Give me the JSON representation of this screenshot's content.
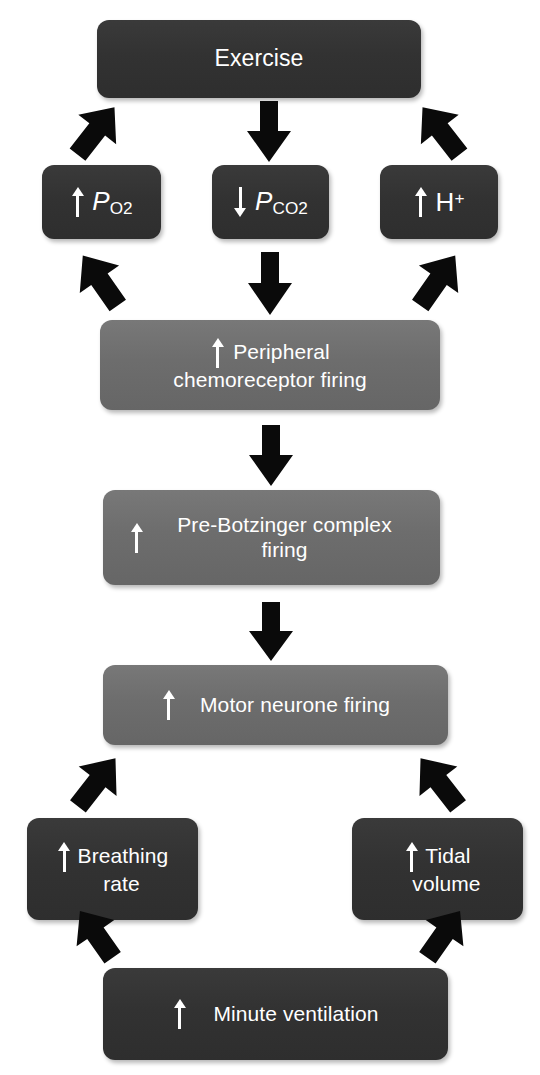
{
  "diagram": {
    "colors": {
      "dark_node": "#333333",
      "gray_node": "#6d6d6d",
      "arrow": "#0a0a0a",
      "text": "#ffffff",
      "background": "#ffffff"
    },
    "nodes": [
      {
        "id": "exercise",
        "label": "Exercise",
        "shade": "dark",
        "change": "none"
      },
      {
        "id": "po2",
        "label": "P",
        "sub": "O2",
        "shade": "dark",
        "change": "increase",
        "arrow_glyph": "up-arrow-icon"
      },
      {
        "id": "pco2",
        "label": "P",
        "sub": "CO2",
        "shade": "dark",
        "change": "decrease",
        "arrow_glyph": "down-arrow-icon"
      },
      {
        "id": "hplus",
        "label": "H",
        "sup": "+",
        "shade": "dark",
        "change": "increase",
        "arrow_glyph": "up-arrow-icon"
      },
      {
        "id": "peripheral-chemoreceptor",
        "line1": "Peripheral",
        "line2": "chemoreceptor firing",
        "shade": "gray",
        "change": "increase",
        "arrow_glyph": "up-arrow-icon"
      },
      {
        "id": "pre-botzinger",
        "line1": "Pre-Botzinger complex",
        "line2": "firing",
        "shade": "gray",
        "change": "increase",
        "arrow_glyph": "up-arrow-icon"
      },
      {
        "id": "motor-neurone",
        "label": "Motor neurone firing",
        "shade": "gray",
        "change": "increase",
        "arrow_glyph": "up-arrow-icon"
      },
      {
        "id": "breathing-rate",
        "line1": "Breathing",
        "line2": "rate",
        "shade": "dark",
        "change": "increase",
        "arrow_glyph": "up-arrow-icon"
      },
      {
        "id": "tidal-volume",
        "line1": "Tidal",
        "line2": "volume",
        "shade": "dark",
        "change": "increase",
        "arrow_glyph": "up-arrow-icon"
      },
      {
        "id": "minute-ventilation",
        "label": "Minute ventilation",
        "shade": "dark",
        "change": "increase",
        "arrow_glyph": "up-arrow-icon"
      }
    ],
    "connectors": [
      {
        "id": "exercise-to-po2",
        "from": "exercise",
        "to": "po2",
        "direction": "down-left"
      },
      {
        "id": "exercise-to-pco2",
        "from": "exercise",
        "to": "pco2",
        "direction": "down"
      },
      {
        "id": "exercise-to-hplus",
        "from": "exercise",
        "to": "hplus",
        "direction": "down-right"
      },
      {
        "id": "po2-to-chemoreceptor",
        "from": "po2",
        "to": "peripheral-chemoreceptor",
        "direction": "down-right"
      },
      {
        "id": "pco2-to-chemoreceptor",
        "from": "pco2",
        "to": "peripheral-chemoreceptor",
        "direction": "down"
      },
      {
        "id": "hplus-to-chemoreceptor",
        "from": "hplus",
        "to": "peripheral-chemoreceptor",
        "direction": "down-left"
      },
      {
        "id": "chemoreceptor-to-prebotzinger",
        "from": "peripheral-chemoreceptor",
        "to": "pre-botzinger",
        "direction": "down"
      },
      {
        "id": "prebotzinger-to-motor",
        "from": "pre-botzinger",
        "to": "motor-neurone",
        "direction": "down"
      },
      {
        "id": "motor-to-breathing-rate",
        "from": "motor-neurone",
        "to": "breathing-rate",
        "direction": "down-left"
      },
      {
        "id": "motor-to-tidal-volume",
        "from": "motor-neurone",
        "to": "tidal-volume",
        "direction": "down-right"
      },
      {
        "id": "breathing-rate-to-minute",
        "from": "breathing-rate",
        "to": "minute-ventilation",
        "direction": "down-right"
      },
      {
        "id": "tidal-volume-to-minute",
        "from": "tidal-volume",
        "to": "minute-ventilation",
        "direction": "down-left"
      }
    ]
  }
}
